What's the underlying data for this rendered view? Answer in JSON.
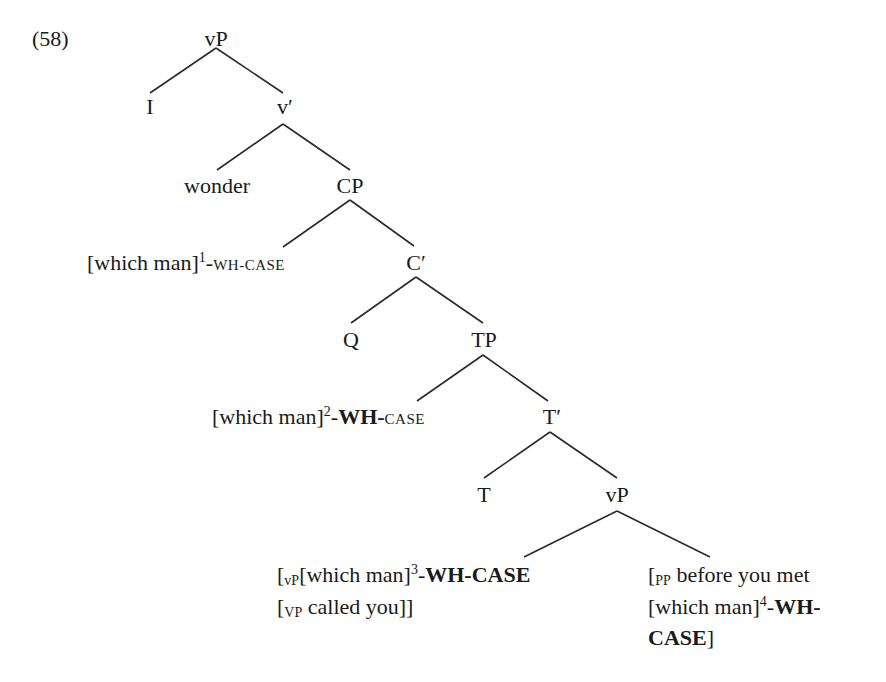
{
  "example_number": "(58)",
  "tree": {
    "root": "vP",
    "nodes": {
      "vP_top": "vP",
      "I": "I",
      "v_bar": "v′",
      "wonder": "wonder",
      "CP": "CP",
      "spec_CP": {
        "open": "[which man]",
        "index": "1",
        "dash1": "-",
        "feat1": "WH",
        "dash2": "-",
        "feat2": "CASE",
        "feat1_style": "smallcaps",
        "feat2_style": "smallcaps"
      },
      "C_bar": "C′",
      "Q": "Q",
      "TP": "TP",
      "spec_TP": {
        "open": "[which man]",
        "index": "2",
        "dash1": "-",
        "feat1": "WH",
        "dash2": "-",
        "feat2": "CASE",
        "feat1_style": "bold",
        "feat2_style": "smallcaps"
      },
      "T_bar": "T′",
      "T": "T",
      "vP_low": "vP",
      "vP_left": {
        "line1_bracket": "[",
        "line1_sub": "vP",
        "line1_text": "[which man]",
        "line1_index": "3",
        "line1_dash": "-",
        "line1_bold": "WH-CASE",
        "line2_bracket": "[",
        "line2_sub": "VP",
        "line2_text": " called you]]"
      },
      "PP_right": {
        "line1_bracket": "[",
        "line1_sub": "PP",
        "line1_text": " before you met",
        "line2_text": "[which man]",
        "line2_index": "4",
        "line2_dash": "-",
        "line2_bold": "WH-",
        "line3_bold": "CASE",
        "line3_close": "]"
      }
    },
    "edges": [
      {
        "from": "vP_top",
        "to": "I"
      },
      {
        "from": "vP_top",
        "to": "v_bar"
      },
      {
        "from": "v_bar",
        "to": "wonder"
      },
      {
        "from": "v_bar",
        "to": "CP"
      },
      {
        "from": "CP",
        "to": "spec_CP"
      },
      {
        "from": "CP",
        "to": "C_bar"
      },
      {
        "from": "C_bar",
        "to": "Q"
      },
      {
        "from": "C_bar",
        "to": "TP"
      },
      {
        "from": "TP",
        "to": "spec_TP"
      },
      {
        "from": "TP",
        "to": "T_bar"
      },
      {
        "from": "T_bar",
        "to": "T"
      },
      {
        "from": "T_bar",
        "to": "vP_low"
      },
      {
        "from": "vP_low",
        "to": "vP_left"
      },
      {
        "from": "vP_low",
        "to": "PP_right"
      }
    ]
  },
  "colors": {
    "text": "#1a1a1a",
    "lines": "#2a2a2a",
    "background": "#ffffff"
  }
}
